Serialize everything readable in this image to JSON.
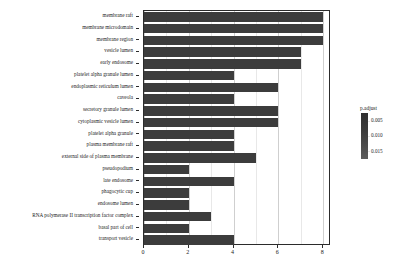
{
  "chart_data": {
    "type": "bar",
    "orientation": "horizontal",
    "title": "",
    "xlabel": "",
    "ylabel": "",
    "xlim": [
      0,
      8.35
    ],
    "xticks": [
      0,
      2,
      4,
      6,
      8
    ],
    "xticklabels": [
      "0",
      "2",
      "4",
      "6",
      "8"
    ],
    "grid": true,
    "grid_axis": "x",
    "legend": {
      "title": "p.adjust",
      "position": "right",
      "type": "colorbar",
      "ticks": [
        0.005,
        0.01,
        0.015
      ],
      "ticklabels": [
        "0.005",
        "0.010",
        "0.015"
      ],
      "colors": [
        "#2f2f2f",
        "#5c5c5c"
      ]
    },
    "bar_color": "#3c3c3c",
    "categories": [
      "membrane raft",
      "membrane microdomain",
      "membrane region",
      "vesicle lumen",
      "early endosome",
      "platelet alpha granule lumen",
      "endoplasmic reticulum lumen",
      "caveola",
      "secretory granule lumen",
      "cytoplasmic vesicle lumen",
      "platelet alpha granule",
      "plasma membrane raft",
      "external side of plasma membrane",
      "pseudopodium",
      "late endosome",
      "phagocytic cup",
      "endosome lumen",
      "RNA polymerase II transcription factor complex",
      "basal part of cell",
      "transport vesicle"
    ],
    "values": [
      8,
      8,
      8,
      7,
      7,
      4,
      6,
      4,
      6,
      6,
      4,
      4,
      5,
      2,
      4,
      2,
      2,
      3,
      2,
      4
    ]
  }
}
